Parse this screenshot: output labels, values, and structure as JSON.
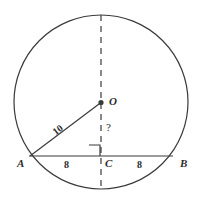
{
  "figure": {
    "type": "geometry-diagram",
    "stroke_color": "#3a3a3a",
    "label_color": "#2b2b2b",
    "background_color": "#ffffff"
  },
  "points": {
    "center": {
      "label": "O",
      "x": 101,
      "y": 102
    },
    "left_chord_end": {
      "label": "A",
      "x": 30,
      "y": 156
    },
    "right_chord_end": {
      "label": "B",
      "x": 172,
      "y": 156
    },
    "chord_midpoint": {
      "label": "C",
      "x": 101,
      "y": 156
    }
  },
  "measurements": {
    "radius_label": "10",
    "left_half_chord": "8",
    "right_half_chord": "8",
    "unknown_label": "?"
  },
  "elements": {
    "circle": {
      "cx": 101,
      "cy": 102,
      "r": 87
    },
    "chord": {
      "x1": 30,
      "y1": 156,
      "x2": 172,
      "y2": 156
    },
    "radius_segment": {
      "x1": 30,
      "y1": 156,
      "x2": 101,
      "y2": 102
    },
    "vertical_dashed": {
      "x": 101,
      "y1": 15,
      "y2": 189
    },
    "right_angle_marker": {
      "x": 90,
      "y": 145,
      "size": 11
    }
  }
}
